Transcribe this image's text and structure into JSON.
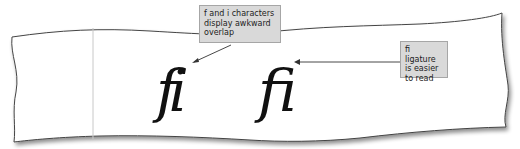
{
  "diagram": {
    "left_sample": {
      "text": "fi",
      "description": "f and i as separate characters"
    },
    "right_sample": {
      "text": "ﬁ",
      "description": "fi ligature"
    },
    "callouts": [
      {
        "id": "overlap",
        "text": "f and i characters\ndisplay awkward\noverlap"
      },
      {
        "id": "ligature",
        "text": "fi ligature\nis easier\nto read"
      }
    ],
    "colors": {
      "callout_fill": "#d9d9d9",
      "callout_border": "#a6a6a6",
      "paper": "#ffffff",
      "outline": "#555555"
    }
  }
}
